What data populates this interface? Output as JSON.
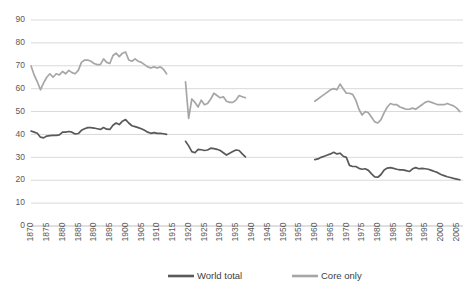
{
  "chart_data": {
    "type": "line",
    "title": "",
    "xlabel": "",
    "ylabel": "",
    "ylim": [
      0,
      90
    ],
    "ytick_step": 10,
    "yticks": [
      0,
      10,
      20,
      30,
      40,
      50,
      60,
      70,
      80,
      90
    ],
    "xlim": [
      1870,
      2007
    ],
    "xticks": [
      1870,
      1875,
      1880,
      1885,
      1890,
      1895,
      1900,
      1905,
      1910,
      1915,
      1920,
      1925,
      1930,
      1935,
      1940,
      1945,
      1950,
      1955,
      1960,
      1965,
      1970,
      1975,
      1980,
      1985,
      1990,
      1995,
      2000,
      2005
    ],
    "grid": true,
    "grid_axis": "y",
    "legend_position": "bottom",
    "legend": [
      "World total",
      "Core only"
    ],
    "colors": {
      "world_total": "#595959",
      "core_only": "#a6a6a6",
      "gridline": "#d9d9d9",
      "axis": "#bfbfbf",
      "tick_label": "#595959",
      "legend_label": "#404040"
    },
    "series": [
      {
        "name": "World total",
        "color": "#595959",
        "segments": [
          {
            "label": "1870-1913",
            "x": [
              1870,
              1871,
              1872,
              1873,
              1874,
              1875,
              1876,
              1877,
              1878,
              1879,
              1880,
              1881,
              1882,
              1883,
              1884,
              1885,
              1886,
              1887,
              1888,
              1889,
              1890,
              1891,
              1892,
              1893,
              1894,
              1895,
              1896,
              1897,
              1898,
              1899,
              1900,
              1901,
              1902,
              1903,
              1904,
              1905,
              1906,
              1907,
              1908,
              1909,
              1910,
              1911,
              1912,
              1913
            ],
            "y": [
              41.5,
              41.0,
              40.5,
              38.8,
              38.5,
              39.3,
              39.5,
              39.6,
              39.6,
              39.8,
              41.0,
              41.0,
              41.3,
              41.0,
              40.2,
              40.4,
              41.8,
              42.5,
              43.0,
              43.0,
              42.8,
              42.5,
              42.2,
              43.0,
              42.3,
              42.2,
              44.0,
              45.0,
              44.3,
              45.8,
              46.5,
              45.0,
              43.8,
              43.4,
              43.0,
              42.5,
              41.8,
              41.0,
              40.5,
              40.8,
              40.5,
              40.5,
              40.3,
              40.0
            ]
          },
          {
            "label": "1919-1938",
            "x": [
              1919,
              1920,
              1921,
              1922,
              1923,
              1924,
              1925,
              1926,
              1927,
              1928,
              1929,
              1930,
              1931,
              1932,
              1933,
              1934,
              1935,
              1936,
              1937,
              1938
            ],
            "y": [
              37.0,
              35.0,
              32.5,
              32.0,
              33.5,
              33.3,
              33.0,
              33.2,
              34.0,
              33.8,
              33.5,
              33.0,
              32.0,
              31.0,
              31.8,
              32.5,
              33.2,
              33.0,
              31.5,
              30.2
            ]
          },
          {
            "label": "1960-2006",
            "x": [
              1960,
              1961,
              1962,
              1963,
              1964,
              1965,
              1966,
              1967,
              1968,
              1969,
              1970,
              1971,
              1972,
              1973,
              1974,
              1975,
              1976,
              1977,
              1978,
              1979,
              1980,
              1981,
              1982,
              1983,
              1984,
              1985,
              1986,
              1987,
              1988,
              1989,
              1990,
              1991,
              1992,
              1993,
              1994,
              1995,
              1996,
              1997,
              1998,
              1999,
              2000,
              2001,
              2002,
              2003,
              2004,
              2005,
              2006
            ],
            "y": [
              29.0,
              29.3,
              30.0,
              30.5,
              31.0,
              31.5,
              32.2,
              31.5,
              31.8,
              30.5,
              30.0,
              26.5,
              26.0,
              26.0,
              25.2,
              24.8,
              25.0,
              24.3,
              22.8,
              21.5,
              21.3,
              22.5,
              24.5,
              25.3,
              25.5,
              25.2,
              24.8,
              24.5,
              24.5,
              24.2,
              23.8,
              25.0,
              25.5,
              25.0,
              25.2,
              25.0,
              24.8,
              24.3,
              23.8,
              23.3,
              22.5,
              22.0,
              21.5,
              21.2,
              20.8,
              20.5,
              20.2
            ]
          }
        ]
      },
      {
        "name": "Core only",
        "color": "#a6a6a6",
        "segments": [
          {
            "label": "1870-1913",
            "x": [
              1870,
              1871,
              1872,
              1873,
              1874,
              1875,
              1876,
              1877,
              1878,
              1879,
              1880,
              1881,
              1882,
              1883,
              1884,
              1885,
              1886,
              1887,
              1888,
              1889,
              1890,
              1891,
              1892,
              1893,
              1894,
              1895,
              1896,
              1897,
              1898,
              1899,
              1900,
              1901,
              1902,
              1903,
              1904,
              1905,
              1906,
              1907,
              1908,
              1909,
              1910,
              1911,
              1912,
              1913
            ],
            "y": [
              70.0,
              66.0,
              63.0,
              59.5,
              62.5,
              65.0,
              66.5,
              65.0,
              66.5,
              66.0,
              67.5,
              66.5,
              68.0,
              67.0,
              66.5,
              68.0,
              71.5,
              72.5,
              72.5,
              72.0,
              71.0,
              70.5,
              70.5,
              73.0,
              71.5,
              71.0,
              74.5,
              75.5,
              74.0,
              75.5,
              76.0,
              72.5,
              72.0,
              73.0,
              72.0,
              71.5,
              70.5,
              69.5,
              69.0,
              69.5,
              69.0,
              69.5,
              68.5,
              66.5
            ]
          },
          {
            "label": "1919-1938",
            "x": [
              1919,
              1920,
              1921,
              1922,
              1923,
              1924,
              1925,
              1926,
              1927,
              1928,
              1929,
              1930,
              1931,
              1932,
              1933,
              1934,
              1935,
              1936,
              1937,
              1938
            ],
            "y": [
              63.0,
              47.0,
              55.5,
              54.0,
              52.0,
              55.0,
              53.0,
              53.5,
              55.5,
              58.0,
              57.0,
              56.0,
              56.5,
              54.5,
              54.0,
              54.0,
              55.0,
              57.0,
              56.5,
              56.0
            ]
          },
          {
            "label": "1960-2006",
            "x": [
              1960,
              1961,
              1962,
              1963,
              1964,
              1965,
              1966,
              1967,
              1968,
              1969,
              1970,
              1971,
              1972,
              1973,
              1974,
              1975,
              1976,
              1977,
              1978,
              1979,
              1980,
              1981,
              1982,
              1983,
              1984,
              1985,
              1986,
              1987,
              1988,
              1989,
              1990,
              1991,
              1992,
              1993,
              1994,
              1995,
              1996,
              1997,
              1998,
              1999,
              2000,
              2001,
              2002,
              2003,
              2004,
              2005,
              2006
            ],
            "y": [
              54.5,
              55.5,
              56.5,
              57.5,
              58.5,
              59.5,
              60.0,
              59.5,
              62.0,
              60.0,
              58.0,
              58.0,
              57.5,
              55.0,
              51.0,
              48.5,
              50.0,
              49.5,
              47.5,
              45.5,
              45.0,
              46.5,
              49.5,
              52.0,
              53.5,
              53.0,
              53.0,
              52.0,
              51.5,
              51.0,
              51.0,
              51.5,
              51.0,
              52.0,
              53.0,
              54.0,
              54.5,
              54.0,
              53.5,
              53.0,
              53.0,
              53.0,
              53.5,
              53.0,
              52.5,
              51.5,
              50.0
            ]
          }
        ]
      }
    ]
  },
  "legend": {
    "items": [
      {
        "label": "World total",
        "color": "#595959"
      },
      {
        "label": "Core only",
        "color": "#a6a6a6"
      }
    ]
  }
}
